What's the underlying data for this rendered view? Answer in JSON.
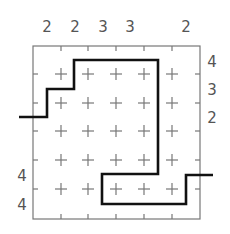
{
  "puzzle": {
    "grid_size": {
      "rows": 6,
      "cols": 6
    },
    "top_clues": [
      "2",
      "2",
      "3",
      "3",
      "",
      "2"
    ],
    "right_clues": [
      "4",
      "3",
      "2",
      "",
      "",
      ""
    ],
    "left_clues": [
      "",
      "",
      "",
      "",
      "4",
      "4"
    ],
    "colors": {
      "grid": "#777777",
      "path": "#111111",
      "clue": "#555555"
    }
  }
}
